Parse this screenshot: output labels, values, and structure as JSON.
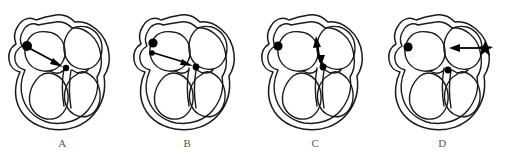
{
  "figure": {
    "panel_count": 4,
    "line_color": "#1a1a1a",
    "marker_color": "#000000",
    "label_color": "#58585a",
    "background": "#ffffff"
  },
  "panels": [
    {
      "id": "panel-a",
      "label": "A",
      "markers": [
        {
          "name": "sa-node-dot",
          "type": "dot",
          "radius": 5.0,
          "cx": 27,
          "cy": 46
        },
        {
          "name": "av-node-dot",
          "type": "dot",
          "radius": 3.2,
          "cx": 66,
          "cy": 68
        }
      ],
      "arrows": [
        {
          "name": "conduction-arrow",
          "direction": "down-right",
          "x1": 29,
          "y1": 48,
          "x2": 62,
          "y2": 66,
          "double_headed": false
        }
      ]
    },
    {
      "id": "panel-b",
      "label": "B",
      "markers": [
        {
          "name": "sa-node-dot",
          "type": "dot",
          "radius": 4.6,
          "cx": 28,
          "cy": 43
        },
        {
          "name": "ectopic-focus-dot",
          "type": "dot",
          "radius": 2.8,
          "cx": 27,
          "cy": 53
        },
        {
          "name": "av-node-dot",
          "type": "dot",
          "radius": 3.4,
          "cx": 71,
          "cy": 67
        }
      ],
      "arrows": [
        {
          "name": "conduction-arrow",
          "direction": "down-right",
          "x1": 29,
          "y1": 53,
          "x2": 67,
          "y2": 66,
          "double_headed": false
        }
      ]
    },
    {
      "id": "panel-c",
      "label": "C",
      "markers": [
        {
          "name": "sa-node-dot",
          "type": "dot",
          "radius": 4.6,
          "cx": 25,
          "cy": 46
        },
        {
          "name": "av-node-dot",
          "type": "dot",
          "radius": 3.4,
          "cx": 70,
          "cy": 67
        }
      ],
      "arrows": [
        {
          "name": "retrograde-arrow",
          "direction": "vertical-double",
          "x1": 67,
          "y1": 65,
          "x2": 64,
          "y2": 40,
          "double_headed": true
        }
      ]
    },
    {
      "id": "panel-d",
      "label": "D",
      "markers": [
        {
          "name": "sa-node-dot",
          "type": "dot",
          "radius": 4.6,
          "cx": 28,
          "cy": 47
        },
        {
          "name": "av-node-dot",
          "type": "dot",
          "radius": 3.4,
          "cx": 68,
          "cy": 70
        },
        {
          "name": "accessory-pathway-star",
          "type": "star",
          "radius": 6.0,
          "cx": 105,
          "cy": 48
        }
      ],
      "arrows": [
        {
          "name": "accessory-conduction-arrow",
          "direction": "left",
          "x1": 104,
          "y1": 48,
          "x2": 70,
          "y2": 48,
          "double_headed": false
        }
      ]
    }
  ]
}
